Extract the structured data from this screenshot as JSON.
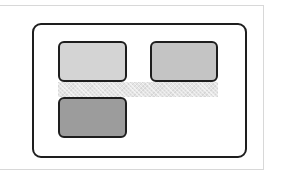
{
  "diagram": {
    "type": "layout-wireframe",
    "colors": {
      "frame_border": "#d8d8d8",
      "container_border": "#1e1e1e",
      "box_border": "#1e1e1e",
      "strip_fill": "#e4e4e4"
    },
    "boxes": [
      {
        "id": "box-1",
        "position": "top-left",
        "fill": "#d4d4d4",
        "x": 58,
        "y": 41,
        "w": 69,
        "h": 41
      },
      {
        "id": "box-2",
        "position": "top-right",
        "fill": "#c4c4c4",
        "x": 150,
        "y": 41,
        "w": 68,
        "h": 41
      },
      {
        "id": "box-3",
        "position": "bottom-left",
        "fill": "#9c9c9c",
        "x": 58,
        "y": 97,
        "w": 69,
        "h": 41
      }
    ],
    "strip": {
      "pattern": "hatched",
      "x": 58,
      "y": 82,
      "w": 160,
      "h": 15
    }
  }
}
